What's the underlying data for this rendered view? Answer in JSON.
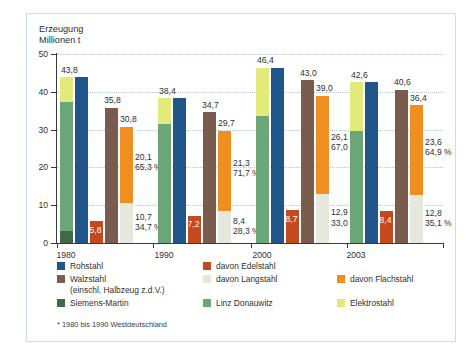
{
  "chart_data": {
    "type": "bar",
    "title": "",
    "ylabel": "Erzeugung\nMillionen t",
    "xlabel": "",
    "ylim": [
      0,
      50
    ],
    "yticks": [
      0,
      10,
      20,
      30,
      40,
      50
    ],
    "grid": true,
    "categories": [
      "1980",
      "1990",
      "2000",
      "2003"
    ],
    "legend_position": "bottom",
    "footnote": "* 1980 bis 1990 Westdeutschland",
    "series": [
      {
        "name": "Rohstahl",
        "color": "#20558a",
        "values": [
          43.8,
          38.4,
          46.4,
          42.6
        ]
      },
      {
        "name": "davon Edelstahl",
        "color": "#c4491c",
        "values": [
          5.8,
          7.2,
          8.7,
          8.4
        ]
      },
      {
        "name": "Walzstahl",
        "color": "#7a5c4e",
        "values": [
          35.8,
          34.7,
          43.0,
          40.6
        ]
      },
      {
        "name": "davon Langstahl",
        "color": "#e6e8de",
        "values": [
          10.7,
          8.4,
          12.9,
          12.8
        ]
      },
      {
        "name": "davon Flachstahl",
        "color": "#ef8f22",
        "values": [
          20.1,
          21.3,
          26.1,
          23.6
        ]
      },
      {
        "name": "Siemens-Martin",
        "color": "#3e6b46",
        "values": [
          3.3,
          0.0,
          0.0,
          0.0
        ]
      },
      {
        "name": "Linz Donauwitz",
        "color": "#6aa678",
        "values": [
          34.1,
          31.6,
          33.6,
          29.7
        ]
      },
      {
        "name": "Elektrostahl",
        "color": "#e2ea7a",
        "values": [
          6.4,
          6.8,
          12.8,
          12.9
        ]
      }
    ],
    "labels": {
      "rohstahl_total": [
        "43,8",
        "38,4",
        "46,4",
        "42,6"
      ],
      "edelstahl": [
        "5,8",
        "7,2",
        "8,7",
        "8,4"
      ],
      "walzstahl_total": [
        "35,8",
        "34,7",
        "43,0",
        "40,6"
      ],
      "flachstahl": [
        "30,8",
        "29,7",
        "39,0",
        "36,4"
      ],
      "flachstahl_value": [
        "20,1",
        "21,3",
        "26,1",
        "23,6"
      ],
      "flachstahl_pct": [
        "65,3 %",
        "71,7 %",
        "67,0 %",
        "64,9 %"
      ],
      "langstahl_value": [
        "10,7",
        "8,4",
        "12,9",
        "12,8"
      ],
      "langstahl_pct": [
        "34,7 %",
        "28,3 %",
        "33,0 %",
        "35,1 %"
      ]
    }
  },
  "legend": {
    "items": [
      {
        "label": "Rohstahl",
        "color": "#20558a"
      },
      {
        "label": "Walzstahl\n(einschl. Halbzeug z.d.V.)",
        "color": "#7a5c4e"
      },
      {
        "label": "Siemens-Martin",
        "color": "#3e6b46"
      },
      {
        "label": "davon Edelstahl",
        "color": "#c4491c"
      },
      {
        "label": "davon Langstahl",
        "color": "#e6e8de"
      },
      {
        "label": "Linz Donauwitz",
        "color": "#6aa678"
      },
      {
        "label": "davon Flachstahl",
        "color": "#ef8f22"
      },
      {
        "label": "Elektrostahl",
        "color": "#e2ea7a"
      }
    ]
  },
  "axis": {
    "ylabel": "Erzeugung\nMillionen t",
    "yticks": [
      "50",
      "40",
      "30",
      "20",
      "10",
      "0"
    ],
    "xticks": [
      "1980",
      "1990",
      "2000",
      "2003"
    ]
  },
  "footnote": "* 1980 bis 1990 Westdeutschland"
}
